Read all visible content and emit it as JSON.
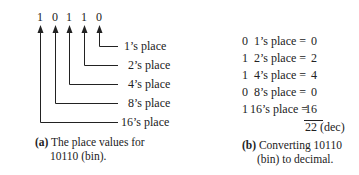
{
  "left_figure": {
    "digits": [
      "1",
      "0",
      "1",
      "1",
      "0"
    ],
    "place_labels": [
      "1’s place",
      "2’s place",
      "4’s place",
      "8’s place",
      "16’s place"
    ],
    "caption": {
      "tag": "(a)",
      "line1": "The place values for",
      "line2": "10110 (bin)."
    }
  },
  "right_figure": {
    "rows": [
      {
        "bit": "0",
        "place": "1’s place =",
        "value": "0"
      },
      {
        "bit": "1",
        "place": "2’s place =",
        "value": "2"
      },
      {
        "bit": "1",
        "place": "4’s place =",
        "value": "4"
      },
      {
        "bit": "0",
        "place": "8’s place =",
        "value": "0"
      },
      {
        "bit": "1",
        "place": "16’s place =",
        "value": "16"
      }
    ],
    "total": "22 (dec)",
    "caption": {
      "tag": "(b)",
      "line1": "Converting 10110",
      "line2": "(bin) to decimal."
    }
  }
}
